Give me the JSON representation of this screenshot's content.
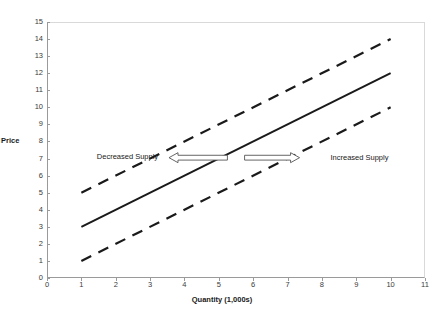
{
  "clipped_header": "...",
  "chart_data": {
    "type": "line",
    "title": "",
    "xlabel": "Quantity (1,000s)",
    "ylabel": "Price",
    "xlim": [
      0,
      11
    ],
    "ylim": [
      0,
      15
    ],
    "xticks": [
      0,
      1,
      2,
      3,
      4,
      5,
      6,
      7,
      8,
      9,
      10,
      11
    ],
    "yticks": [
      0,
      1,
      2,
      3,
      4,
      5,
      6,
      7,
      8,
      9,
      10,
      11,
      12,
      13,
      14,
      15
    ],
    "grid": false,
    "legend": "none",
    "series": [
      {
        "name": "Decreased Supply",
        "style": "dashed",
        "color": "#1a1a1a",
        "x": [
          1,
          10
        ],
        "values": [
          5,
          14
        ]
      },
      {
        "name": "Original Supply",
        "style": "solid",
        "color": "#1a1a1a",
        "x": [
          1,
          10
        ],
        "values": [
          3,
          12
        ]
      },
      {
        "name": "Increased Supply",
        "style": "dashed",
        "color": "#1a1a1a",
        "x": [
          1,
          10
        ],
        "values": [
          1,
          10
        ]
      }
    ],
    "annotations": [
      {
        "name": "decreased-supply-label",
        "text": "Decreased Supply",
        "x": 1.45,
        "y": 7.1,
        "anchor": "start"
      },
      {
        "name": "increased-supply-label",
        "text": "Increased Supply",
        "x": 8.25,
        "y": 7.05,
        "anchor": "start"
      },
      {
        "name": "left-shift-arrow",
        "text": "",
        "x1": 5.25,
        "x2": 3.55,
        "y": 7.05,
        "direction": "left",
        "fill": "#ffffff",
        "stroke": "#555555"
      },
      {
        "name": "right-shift-arrow",
        "text": "",
        "x1": 5.75,
        "x2": 7.35,
        "y": 7.05,
        "direction": "right",
        "fill": "#ffffff",
        "stroke": "#555555"
      }
    ]
  },
  "colors": {
    "line": "#1a1a1a",
    "axis": "#9a9a9a",
    "frame_light": "#d9d9d9",
    "text": "#1a1a1a",
    "tick_text": "#3a3a3a",
    "arrow_stroke": "#555555",
    "background": "#ffffff"
  }
}
